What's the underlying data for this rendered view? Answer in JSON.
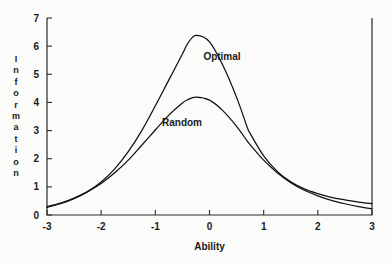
{
  "chart_data": {
    "type": "line",
    "title": "",
    "xlabel": "Ability",
    "ylabel": "Information",
    "xlim": [
      -3,
      3
    ],
    "ylim": [
      0,
      7
    ],
    "xticks": [
      "-3",
      "-2",
      "-1",
      "0",
      "1",
      "2",
      "3"
    ],
    "xtick_values": [
      -3,
      -2,
      -1,
      0,
      1,
      2,
      3
    ],
    "yticks": [
      "0",
      "1",
      "2",
      "3",
      "4",
      "5",
      "6",
      "7"
    ],
    "ytick_values": [
      0,
      1,
      2,
      3,
      4,
      5,
      6,
      7
    ],
    "grid": false,
    "legend_position": "inline-annotation",
    "x": [
      -3,
      -2.75,
      -2.5,
      -2.25,
      -2,
      -1.75,
      -1.5,
      -1.25,
      -1,
      -0.75,
      -0.5,
      -0.4,
      -0.25,
      0,
      0.25,
      0.5,
      0.7,
      0.75,
      1,
      1.25,
      1.5,
      1.75,
      2,
      2.25,
      2.5,
      2.75,
      3
    ],
    "series": [
      {
        "name": "Optimal",
        "label": "Optimal",
        "color": "#111111",
        "peak_x": -0.4,
        "peak_y": 6.42,
        "values": [
          0.27,
          0.4,
          0.58,
          0.83,
          1.17,
          1.64,
          2.25,
          3.0,
          3.88,
          4.8,
          5.72,
          6.1,
          6.38,
          6.15,
          5.3,
          4.18,
          3.1,
          2.9,
          2.1,
          1.55,
          1.18,
          0.93,
          0.76,
          0.63,
          0.54,
          0.46,
          0.4
        ]
      },
      {
        "name": "Random",
        "label": "Random",
        "color": "#111111",
        "peak_x": -0.3,
        "peak_y": 4.2,
        "values": [
          0.3,
          0.42,
          0.6,
          0.83,
          1.12,
          1.5,
          1.95,
          2.48,
          3.02,
          3.55,
          3.98,
          4.1,
          4.19,
          4.08,
          3.7,
          3.15,
          2.62,
          2.5,
          1.95,
          1.5,
          1.15,
          0.88,
          0.68,
          0.52,
          0.4,
          0.3,
          0.22
        ]
      }
    ],
    "annotations": [
      {
        "text": "Optimal",
        "x_px": 222,
        "y_px": 60
      },
      {
        "text": "Random",
        "x_px": 182,
        "y_px": 126
      }
    ]
  },
  "ylabel_letters": [
    "I",
    "n",
    "f",
    "o",
    "r",
    "m",
    "a",
    "t",
    "i",
    "o",
    "n"
  ]
}
